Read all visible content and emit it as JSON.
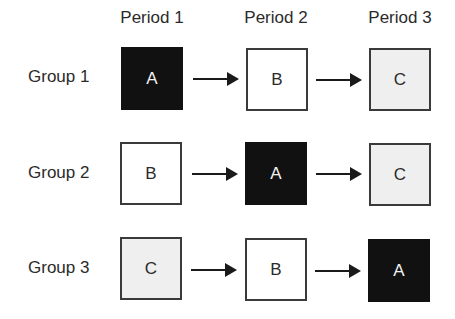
{
  "periods": [
    "Period 1",
    "Period 2",
    "Period 3"
  ],
  "groups": [
    {
      "label": "Group 1",
      "cells": [
        {
          "text": "A",
          "shade": "dark"
        },
        {
          "text": "B",
          "shade": "white"
        },
        {
          "text": "C",
          "shade": "light"
        }
      ]
    },
    {
      "label": "Group 2",
      "cells": [
        {
          "text": "B",
          "shade": "white"
        },
        {
          "text": "A",
          "shade": "dark"
        },
        {
          "text": "C",
          "shade": "light"
        }
      ]
    },
    {
      "label": "Group 3",
      "cells": [
        {
          "text": "C",
          "shade": "light"
        },
        {
          "text": "B",
          "shade": "white"
        },
        {
          "text": "A",
          "shade": "dark"
        }
      ]
    }
  ],
  "colors": {
    "dark": "#111111",
    "white": "#ffffff",
    "light": "#efefef"
  }
}
